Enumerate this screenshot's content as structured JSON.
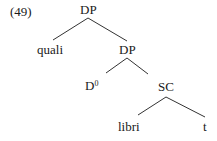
{
  "example_number": "(49)",
  "tree": {
    "root": {
      "label": "DP"
    },
    "nodes": [
      {
        "id": "quali",
        "label": "quali"
      },
      {
        "id": "dp2",
        "label": "DP"
      },
      {
        "id": "d0",
        "label": "D",
        "sup": "0"
      },
      {
        "id": "sc",
        "label": "SC"
      },
      {
        "id": "libri",
        "label": "libri"
      },
      {
        "id": "t",
        "label": "t"
      }
    ],
    "edges": [
      [
        "DP",
        "quali"
      ],
      [
        "DP",
        "DP"
      ],
      [
        "DP",
        "D0"
      ],
      [
        "DP",
        "SC"
      ],
      [
        "SC",
        "libri"
      ],
      [
        "SC",
        "t"
      ]
    ]
  }
}
